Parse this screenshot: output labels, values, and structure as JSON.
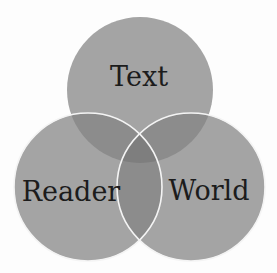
{
  "diagram": {
    "type": "venn",
    "background": "#fdfdfd",
    "colors": {
      "single": "#a4a4a4",
      "double": "#8c8c8c",
      "triple": "#7e7e7e",
      "stroke": "#f4f4f4",
      "text": "#1c1c1c"
    },
    "circles": [
      {
        "id": "text",
        "label": "Text",
        "cx": 140,
        "cy": 90,
        "r": 73
      },
      {
        "id": "reader",
        "label": "Reader",
        "cx": 88,
        "cy": 187,
        "r": 74
      },
      {
        "id": "world",
        "label": "World",
        "cx": 191,
        "cy": 187,
        "r": 74
      }
    ]
  }
}
